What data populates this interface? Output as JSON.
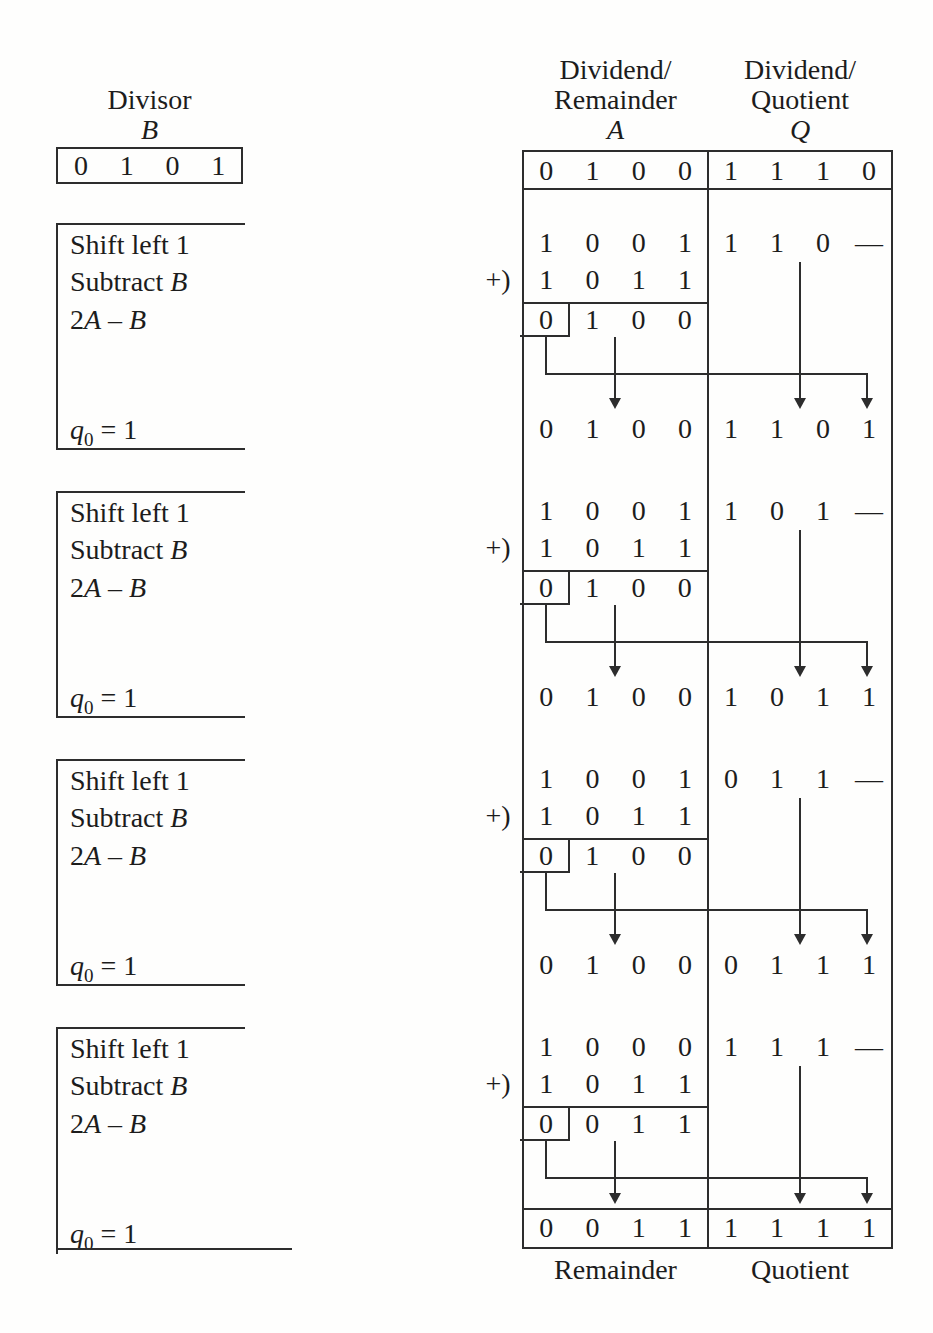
{
  "divisor": {
    "title": "Divisor",
    "symbol": "B",
    "bits": [
      "0",
      "1",
      "0",
      "1"
    ]
  },
  "a_column": {
    "header_line1": "Dividend/",
    "header_line2": "Remainder",
    "symbol": "A",
    "footer": "Remainder"
  },
  "q_column": {
    "header_line1": "Dividend/",
    "header_line2": "Quotient",
    "symbol": "Q",
    "footer": "Quotient"
  },
  "initial": {
    "a": [
      "0",
      "1",
      "0",
      "0"
    ],
    "q": [
      "1",
      "1",
      "1",
      "0"
    ]
  },
  "step_labels": {
    "shift": "Shift left 1",
    "subtract": "Subtract ",
    "subtract_symbol": "B",
    "formula_coeff": "2",
    "formula_a": "A",
    "formula_minus": " – ",
    "formula_b": "B",
    "quotient_var": "q",
    "quotient_sub": "0",
    "quotient_value": " = 1",
    "plus": "+)"
  },
  "steps": [
    {
      "shifted_a": [
        "1",
        "0",
        "0",
        "1"
      ],
      "shifted_q": [
        "1",
        "1",
        "0",
        "—"
      ],
      "addend": [
        "1",
        "0",
        "1",
        "1"
      ],
      "carry": "0",
      "result": [
        "1",
        "0",
        "0"
      ],
      "new_a": [
        "0",
        "1",
        "0",
        "0"
      ],
      "new_q": [
        "1",
        "1",
        "0",
        "1"
      ]
    },
    {
      "shifted_a": [
        "1",
        "0",
        "0",
        "1"
      ],
      "shifted_q": [
        "1",
        "0",
        "1",
        "—"
      ],
      "addend": [
        "1",
        "0",
        "1",
        "1"
      ],
      "carry": "0",
      "result": [
        "1",
        "0",
        "0"
      ],
      "new_a": [
        "0",
        "1",
        "0",
        "0"
      ],
      "new_q": [
        "1",
        "0",
        "1",
        "1"
      ]
    },
    {
      "shifted_a": [
        "1",
        "0",
        "0",
        "1"
      ],
      "shifted_q": [
        "0",
        "1",
        "1",
        "—"
      ],
      "addend": [
        "1",
        "0",
        "1",
        "1"
      ],
      "carry": "0",
      "result": [
        "1",
        "0",
        "0"
      ],
      "new_a": [
        "0",
        "1",
        "0",
        "0"
      ],
      "new_q": [
        "0",
        "1",
        "1",
        "1"
      ]
    },
    {
      "shifted_a": [
        "1",
        "0",
        "0",
        "0"
      ],
      "shifted_q": [
        "1",
        "1",
        "1",
        "—"
      ],
      "addend": [
        "1",
        "0",
        "1",
        "1"
      ],
      "carry": "0",
      "result": [
        "0",
        "1",
        "1"
      ],
      "new_a": [
        "0",
        "0",
        "1",
        "1"
      ],
      "new_q": [
        "1",
        "1",
        "1",
        "1"
      ]
    }
  ],
  "colors": {
    "line": "#2d2d2d",
    "text": "#1c1c1c",
    "background": "#fefefd"
  }
}
